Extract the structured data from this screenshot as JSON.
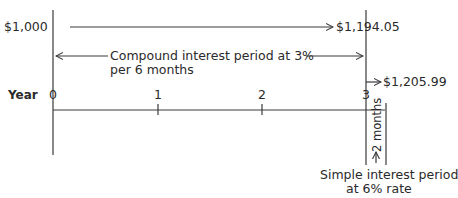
{
  "diagram": {
    "principal": "$1,000",
    "compound_value": "$1,194.05",
    "final_value": "$1,205.99",
    "compound_label_line1": "Compound interest period at 3%",
    "compound_label_line2": "per 6 months",
    "axis_label": "Year",
    "ticks": [
      "0",
      "1",
      "2",
      "3"
    ],
    "two_months_label": "2 months",
    "simple_label_line1": "Simple interest period",
    "simple_label_line2": "at 6% rate"
  },
  "colors": {
    "line": "#3a3a3a",
    "text": "#2a2a2a",
    "background": "#ffffff"
  }
}
